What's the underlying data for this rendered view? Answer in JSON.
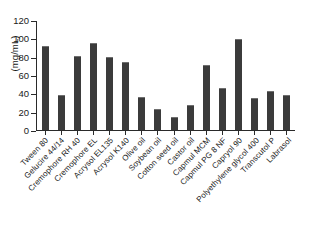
{
  "chart_data": {
    "type": "bar",
    "title": "",
    "xlabel": "",
    "ylabel": "(mg/mL)",
    "ylim": [
      0,
      120
    ],
    "yticks": [
      0,
      20,
      40,
      60,
      80,
      100,
      120
    ],
    "grid": false,
    "legend": null,
    "bar_color": "#3b3b3b",
    "categories": [
      "Tween 80",
      "Gelucire 44/14",
      "Cremophore RH 40",
      "Cremophore EL",
      "Acrysol EL135",
      "Acrysol K140",
      "Olive oil",
      "Soybean oil",
      "Cotton seed oil",
      "Castor oil",
      "Capmul MCM",
      "Capmul PG 8 NF",
      "Capryol 90",
      "Polyethylene glycol 400",
      "Transcutol P",
      "Labrasol"
    ],
    "values": [
      93,
      39,
      82,
      96,
      80.5,
      74.5,
      36,
      23,
      14,
      28,
      72,
      46,
      100,
      35,
      43,
      38
    ]
  },
  "axis": {
    "y_label_text": "(mg/mL)"
  }
}
